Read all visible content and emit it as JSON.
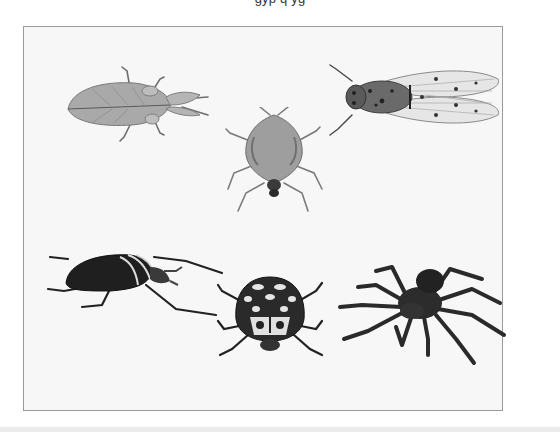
{
  "figure": {
    "caption_partial": "...",
    "frame": {
      "background": "#f7f7f7",
      "border": "#9a9a9a"
    },
    "specimens": [
      {
        "id": "leaf-insect",
        "label": "Leaf insect"
      },
      {
        "id": "stink-bug",
        "label": "Shield bug"
      },
      {
        "id": "cicada",
        "label": "Cicada"
      },
      {
        "id": "goliath-beetle",
        "label": "Goliath beetle"
      },
      {
        "id": "spotted-beetle",
        "label": "Spotted beetle"
      },
      {
        "id": "tarantula",
        "label": "Tarantula"
      }
    ]
  }
}
